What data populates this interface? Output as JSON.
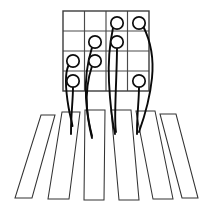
{
  "figure": {
    "background_color": "#ffffff",
    "width": 208,
    "height": 210
  },
  "grid": {
    "label": "4x4 cell grid",
    "rows": 4,
    "cols": 4,
    "x": 63,
    "y": 11,
    "cell_width": 21.5,
    "cell_height": 20,
    "line_color": "#4a4a4a",
    "border_color": "#3c3c3c",
    "line_width": 1.15,
    "border_width": 1.4
  },
  "nodes": {
    "label": "circle nodes",
    "radius": 6.2,
    "fill_color": "#ffffff",
    "stroke_color": "#0d0d0d",
    "stroke_width": 1.7,
    "items": [
      {
        "id": "n1",
        "row": 1,
        "col": 3,
        "cx": 117,
        "cy": 23
      },
      {
        "id": "n2",
        "row": 1,
        "col": 4,
        "cx": 139,
        "cy": 23
      },
      {
        "id": "n3",
        "row": 2,
        "col": 2,
        "cx": 95,
        "cy": 42
      },
      {
        "id": "n4",
        "row": 2,
        "col": 3,
        "cx": 117,
        "cy": 42
      },
      {
        "id": "n5",
        "row": 3,
        "col": 1,
        "cx": 73,
        "cy": 61
      },
      {
        "id": "n6",
        "row": 3,
        "col": 2,
        "cx": 95,
        "cy": 61
      },
      {
        "id": "n7",
        "row": 4,
        "col": 1,
        "cx": 73,
        "cy": 81
      },
      {
        "id": "n8",
        "row": 4,
        "col": 4,
        "cx": 139,
        "cy": 81
      }
    ]
  },
  "edges": {
    "label": "curved connector paths",
    "stroke_color": "#0a0a0a",
    "stroke_width": 1.9,
    "items": [
      {
        "id": "e1",
        "from": "n5",
        "to": "stripe-2",
        "d": "M 68.5 65.5 C 64 75 66 92 68.5 107 C 70 116 72 122 72.5 126"
      },
      {
        "id": "e2",
        "from": "n7",
        "to": "stripe-2",
        "d": "M 73 87.2 C 73 96 72 106 71.5 116 C 71 124 71 130 71 134"
      },
      {
        "id": "e3",
        "from": "n6",
        "to": "stripe-3",
        "d": "M 92 66 C 88 78 86 94 87 108 C 88 120 90 128 92 136"
      },
      {
        "id": "e4",
        "from": "n3",
        "to": "stripe-3",
        "d": "M 92 47.5 C 88 60 85 80 86 98 C 87 114 89 126 92 138"
      },
      {
        "id": "e5",
        "from": "n4",
        "to": "stripe-4",
        "d": "M 117 48.3 C 117 62 116 82 115.5 100 C 115 116 115 126 116 132"
      },
      {
        "id": "e6",
        "from": "n1",
        "to": "stripe-4",
        "d": "M 113 28 C 110 42 108 62 109 82 C 110 102 112 120 115 134"
      },
      {
        "id": "e7",
        "from": "n8",
        "to": "stripe-5",
        "d": "M 139 87.2 C 139 96 138 106 137.5 116 C 137 124 137 130 137 134"
      },
      {
        "id": "e8",
        "from": "n2",
        "to": "stripe-5",
        "d": "M 143.5 27 C 150 40 154 58 152 78 C 150 98 144 118 139 132"
      }
    ]
  },
  "stripes": {
    "label": "fanned parallel stripes",
    "fill_color": "#ffffff",
    "stroke_color": "#333333",
    "stroke_width": 1.05,
    "items": [
      {
        "id": "stripe-1",
        "points": "41,115 55,115 32,198 15,198"
      },
      {
        "id": "stripe-2",
        "points": "62,112 80,112 69,199 48,199"
      },
      {
        "id": "stripe-3",
        "points": "85,110 105,110 104,200 84,200"
      },
      {
        "id": "stripe-4",
        "points": "111,110 131,110 139,200 119,200"
      },
      {
        "id": "stripe-5",
        "points": "136,111 155,111 173,199 153,199"
      },
      {
        "id": "stripe-6",
        "points": "160,114 176,114 198,198 182,198"
      }
    ]
  }
}
